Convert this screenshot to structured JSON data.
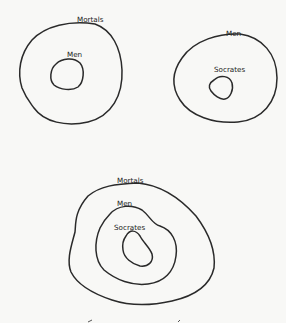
{
  "diagrams": [
    {
      "id": "all-men-are-mortal",
      "sets": [
        {
          "label": "Mortals",
          "role": "outer"
        },
        {
          "label": "Men",
          "role": "inner"
        }
      ]
    },
    {
      "id": "socrates-is-a-man",
      "sets": [
        {
          "label": "Men",
          "role": "outer"
        },
        {
          "label": "Socrates",
          "role": "inner"
        }
      ]
    },
    {
      "id": "therefore-socrates-is-mortal",
      "sets": [
        {
          "label": "Mortals",
          "role": "outer"
        },
        {
          "label": "Men",
          "role": "middle"
        },
        {
          "label": "Socrates",
          "role": "inner"
        }
      ]
    }
  ],
  "colors": {
    "background": "#f8f8f6",
    "stroke": "#2a2a2a",
    "text": "#222222"
  }
}
